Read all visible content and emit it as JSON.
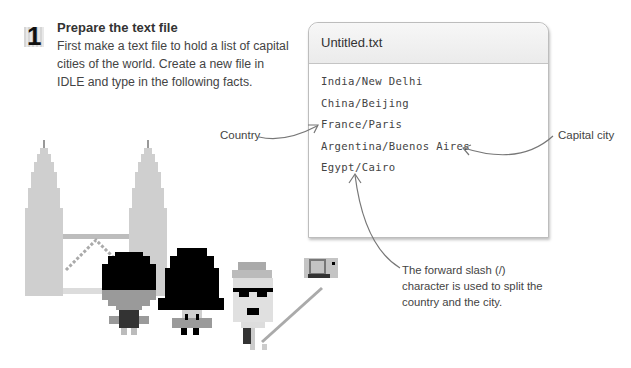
{
  "step": {
    "number": "1",
    "title": "Prepare the text file",
    "body": "First make a text file to hold a list of capital cities of the world. Create a new file in IDLE and type in the following facts."
  },
  "editor_window": {
    "title": "Untitled.txt",
    "lines": [
      "India/New Delhi",
      "China/Beijing",
      "France/Paris",
      "Argentina/Buenos Aires",
      "Egypt/Cairo"
    ]
  },
  "annotations": {
    "country": "Country",
    "capital_city": "Capital city",
    "slash_note": "The forward slash (/) character is used to split the country and the city."
  },
  "illustration": {
    "description": "Pixel-art twin towers with three tourist characters, one taking a selfie",
    "colors": {
      "tower": "#cfcfcf",
      "hair": "#000000",
      "skin": "#d9d9d9",
      "shade": "#9a9a9a"
    }
  }
}
